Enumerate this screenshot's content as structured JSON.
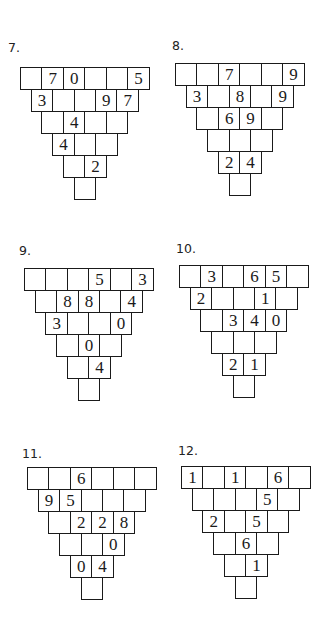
{
  "puzzles": [
    {
      "label": "7.",
      "rows": [
        [
          "",
          "7",
          "0",
          "",
          "",
          "5"
        ],
        [
          "3",
          "",
          "",
          "9",
          "7"
        ],
        [
          "",
          "4",
          "",
          ""
        ],
        [
          "4",
          "",
          ""
        ],
        [
          "",
          "2"
        ],
        [
          ""
        ]
      ]
    },
    {
      "label": "8.",
      "rows": [
        [
          "",
          "",
          "7",
          "",
          "",
          "9"
        ],
        [
          "3",
          "",
          "8",
          "",
          "9"
        ],
        [
          "",
          "6",
          "9",
          ""
        ],
        [
          "",
          "",
          ""
        ],
        [
          "2",
          "4"
        ],
        [
          ""
        ]
      ]
    },
    {
      "label": "9.",
      "rows": [
        [
          "",
          "",
          "",
          "5",
          "",
          "3"
        ],
        [
          "",
          "8",
          "8",
          "",
          "4"
        ],
        [
          "3",
          "",
          "",
          "0"
        ],
        [
          "",
          "0",
          ""
        ],
        [
          "",
          "4"
        ],
        [
          ""
        ]
      ]
    },
    {
      "label": "10.",
      "rows": [
        [
          "",
          "3",
          "",
          "6",
          "5",
          ""
        ],
        [
          "2",
          "",
          "",
          "1",
          ""
        ],
        [
          "",
          "3",
          "4",
          "0"
        ],
        [
          "",
          "",
          ""
        ],
        [
          "2",
          "1"
        ],
        [
          ""
        ]
      ]
    },
    {
      "label": "11.",
      "rows": [
        [
          "",
          "",
          "6",
          "",
          "",
          ""
        ],
        [
          "9",
          "5",
          "",
          "",
          ""
        ],
        [
          "",
          "2",
          "2",
          "8"
        ],
        [
          "",
          "",
          "0"
        ],
        [
          "0",
          "4"
        ],
        [
          ""
        ]
      ]
    },
    {
      "label": "12.",
      "rows": [
        [
          "1",
          "",
          "1",
          "",
          "6",
          ""
        ],
        [
          "",
          "",
          "",
          "5",
          ""
        ],
        [
          "2",
          "",
          "5",
          ""
        ],
        [
          "",
          "6",
          ""
        ],
        [
          "",
          "1"
        ],
        [
          ""
        ]
      ]
    }
  ]
}
